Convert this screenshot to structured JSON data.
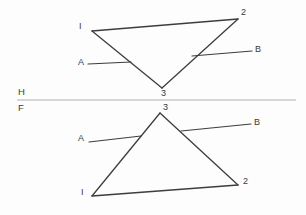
{
  "figure": {
    "background_color": "#fdfdfd",
    "edge_color": "#3d3d3d",
    "fold_line_color": "#b0b0b0",
    "label_color": "#3a3a3a",
    "width": 306,
    "height": 215
  },
  "fold": {
    "top_label": "H",
    "bottom_label": "F",
    "line": {
      "x1": 17,
      "y1": 100,
      "x2": 296,
      "y2": 100
    },
    "top_label_pos": {
      "x": 18,
      "y": 95
    },
    "bottom_label_pos": {
      "x": 18,
      "y": 111
    }
  },
  "top_view": {
    "name": "horizontal-view",
    "vertices": [
      {
        "id": "1",
        "label": "I",
        "x": 92,
        "y": 31,
        "label_x": 79,
        "label_y": 29
      },
      {
        "id": "2",
        "label": "2",
        "x": 238,
        "y": 19,
        "label_x": 241,
        "label_y": 15
      },
      {
        "id": "3",
        "label": "3",
        "x": 162,
        "y": 88,
        "label_x": 161,
        "label_y": 96
      }
    ],
    "edges": [
      {
        "name": "edge-1-2",
        "from": "1",
        "to": "2"
      },
      {
        "name": "edge-2-3",
        "from": "2",
        "to": "3"
      },
      {
        "name": "edge-3-1",
        "from": "3",
        "to": "1"
      }
    ],
    "rays": [
      {
        "name": "line-a",
        "label": "A",
        "x1": 88,
        "y1": 64,
        "x2": 131,
        "y2": 62,
        "label_x": 78,
        "label_y": 65
      },
      {
        "name": "line-b",
        "label": "B",
        "x1": 192,
        "y1": 56,
        "x2": 252,
        "y2": 51,
        "label_x": 255,
        "label_y": 52
      }
    ]
  },
  "front_view": {
    "name": "frontal-view",
    "vertices": [
      {
        "id": "1",
        "label": "I",
        "x": 92,
        "y": 196,
        "label_x": 81,
        "label_y": 195
      },
      {
        "id": "2",
        "label": "2",
        "x": 238,
        "y": 185,
        "label_x": 243,
        "label_y": 184
      },
      {
        "id": "3",
        "label": "3",
        "x": 160,
        "y": 113,
        "label_x": 163,
        "label_y": 110
      }
    ],
    "edges": [
      {
        "name": "edge-1-2",
        "from": "1",
        "to": "2"
      },
      {
        "name": "edge-2-3",
        "from": "2",
        "to": "3"
      },
      {
        "name": "edge-3-1",
        "from": "3",
        "to": "1"
      }
    ],
    "rays": [
      {
        "name": "line-a",
        "label": "A",
        "x1": 89,
        "y1": 142,
        "x2": 141,
        "y2": 136,
        "label_x": 78,
        "label_y": 141
      },
      {
        "name": "line-b",
        "label": "B",
        "x1": 181,
        "y1": 131,
        "x2": 251,
        "y2": 124,
        "label_x": 254,
        "label_y": 125
      }
    ]
  }
}
